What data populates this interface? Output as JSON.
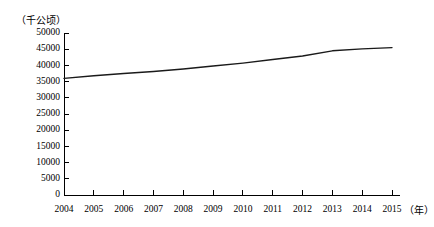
{
  "chart_data": {
    "type": "line",
    "title": "",
    "subtitle": "",
    "xlabel": "（年）",
    "ylabel": "（千公顷）",
    "categories": [
      "2004",
      "2005",
      "2006",
      "2007",
      "2008",
      "2009",
      "2010",
      "2011",
      "2012",
      "2013",
      "2014",
      "2015"
    ],
    "x": [
      2004,
      2005,
      2006,
      2007,
      2008,
      2009,
      2010,
      2011,
      2012,
      2013,
      2014,
      2015
    ],
    "values": [
      36000,
      36800,
      37500,
      38100,
      38900,
      39800,
      40700,
      41800,
      42900,
      44500,
      45100,
      45500
    ],
    "series": [
      {
        "name": "面积",
        "values": [
          36000,
          36800,
          37500,
          38100,
          38900,
          39800,
          40700,
          41800,
          42900,
          44500,
          45100,
          45500
        ]
      }
    ],
    "ylim": [
      0,
      50000
    ],
    "yticks": [
      0,
      5000,
      10000,
      15000,
      20000,
      25000,
      30000,
      35000,
      40000,
      45000,
      50000
    ],
    "ytick_labels": [
      "0",
      "5000",
      "10000",
      "15000",
      "20000",
      "25000",
      "30000",
      "35000",
      "40000",
      "45000",
      "50000"
    ],
    "xlim": [
      2004,
      2015
    ],
    "grid": false,
    "legend": false,
    "legend_position": "none",
    "line_color": "#1a1a1a",
    "axis_color": "#000000",
    "background_color": "#ffffff",
    "annotations": []
  }
}
